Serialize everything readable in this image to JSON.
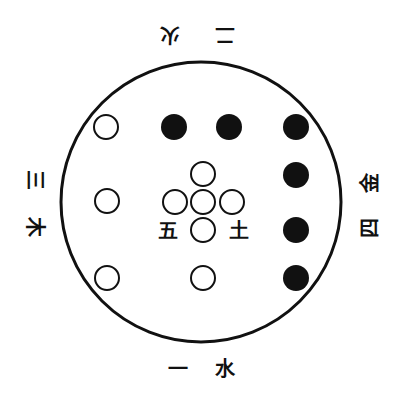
{
  "diagram": {
    "title": "",
    "outer_circle": {
      "cx": 201,
      "cy": 202,
      "r": 140,
      "stroke": "#111111"
    },
    "colors": {
      "filled": "#111111",
      "hollow_stroke": "#111111",
      "background": "#ffffff"
    },
    "labels": {
      "top": {
        "number": "二",
        "element": "火",
        "orientation": "upside-down"
      },
      "bottom": {
        "number": "一",
        "element": "水",
        "orientation": "upright"
      },
      "left": {
        "number": "三",
        "element": "木",
        "orientation": "rotated-clockwise"
      },
      "right": {
        "number": "四",
        "element": "金",
        "orientation": "rotated-counterclockwise"
      },
      "center": {
        "number": "五",
        "element": "土"
      }
    },
    "dots": {
      "top_row_hollow": [
        {
          "cx": 106,
          "cy": 127
        }
      ],
      "top_row_filled": [
        {
          "cx": 174,
          "cy": 127
        },
        {
          "cx": 229,
          "cy": 127
        }
      ],
      "right_column_filled": [
        {
          "cx": 296,
          "cy": 127
        },
        {
          "cx": 296,
          "cy": 175
        },
        {
          "cx": 296,
          "cy": 230
        },
        {
          "cx": 296,
          "cy": 278
        }
      ],
      "left_column_hollow": [
        {
          "cx": 107,
          "cy": 201
        },
        {
          "cx": 107,
          "cy": 278
        }
      ],
      "bottom_hollow": [
        {
          "cx": 203,
          "cy": 278
        }
      ],
      "center_cross_hollow": [
        {
          "cx": 203,
          "cy": 174
        },
        {
          "cx": 175,
          "cy": 202
        },
        {
          "cx": 203,
          "cy": 202
        },
        {
          "cx": 232,
          "cy": 202
        },
        {
          "cx": 203,
          "cy": 230
        }
      ]
    }
  }
}
